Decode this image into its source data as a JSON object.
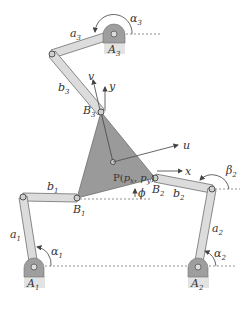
{
  "figure": {
    "colors": {
      "platform": "#9a9a9a",
      "link_fill": "#dcdcdc",
      "link_stroke": "#6e6e6e",
      "base_fill": "#9e9e9e",
      "base_label_bg": "#e3e3e3",
      "line": "#555555",
      "text": "#333333"
    },
    "points": {
      "A1": [
        34,
        267
      ],
      "A2": [
        198,
        267
      ],
      "A3": [
        114,
        34
      ],
      "C1": [
        23,
        197
      ],
      "C2": [
        212,
        189
      ],
      "C3": [
        52,
        54
      ],
      "B1": [
        77,
        198
      ],
      "B2": [
        155,
        178
      ],
      "B3": [
        101,
        112
      ],
      "P": [
        113,
        162
      ]
    },
    "labels": {
      "A1": {
        "main": "A",
        "sub": "1"
      },
      "A2": {
        "main": "A",
        "sub": "2"
      },
      "A3": {
        "main": "A",
        "sub": "3"
      },
      "B1": {
        "main": "B",
        "sub": "1"
      },
      "B2": {
        "main": "B",
        "sub": "2"
      },
      "B3": {
        "main": "B",
        "sub": "3"
      },
      "a1": {
        "main": "a",
        "sub": "1"
      },
      "a2": {
        "main": "a",
        "sub": "2"
      },
      "a3": {
        "main": "a",
        "sub": "3"
      },
      "b1": {
        "main": "b",
        "sub": "1"
      },
      "b2": {
        "main": "b",
        "sub": "2"
      },
      "b3": {
        "main": "b",
        "sub": "3"
      },
      "alpha1": {
        "main": "α",
        "sub": "1"
      },
      "alpha2": {
        "main": "α",
        "sub": "2"
      },
      "alpha3": {
        "main": "α",
        "sub": "3"
      },
      "beta2": {
        "main": "β",
        "sub": "2"
      },
      "phi": "ϕ",
      "P_main": "P(",
      "P_px": "p",
      "P_px_sub": "x",
      "P_comma": ", ",
      "P_py": "p",
      "P_py_sub": "y",
      "P_close": ")",
      "axis_x": "x",
      "axis_y": "y",
      "axis_u": "u",
      "axis_v": "v"
    }
  }
}
